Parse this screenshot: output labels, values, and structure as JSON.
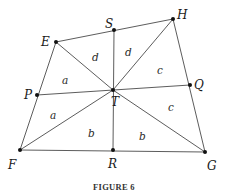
{
  "figure": {
    "caption": "FIGURE 6",
    "points": {
      "E": {
        "label": "E",
        "x": 56,
        "y": 42
      },
      "S": {
        "label": "S",
        "x": 114,
        "y": 30
      },
      "H": {
        "label": "H",
        "x": 173,
        "y": 19
      },
      "Q": {
        "label": "Q",
        "x": 190,
        "y": 85
      },
      "G": {
        "label": "G",
        "x": 205,
        "y": 152
      },
      "R": {
        "label": "R",
        "x": 113,
        "y": 150
      },
      "F": {
        "label": "F",
        "x": 20,
        "y": 150
      },
      "P": {
        "label": "P",
        "x": 37,
        "y": 95
      },
      "T": {
        "label": "T",
        "x": 113,
        "y": 90
      }
    },
    "region_labels": [
      {
        "id": "d1",
        "text": "d"
      },
      {
        "id": "d2",
        "text": "d"
      },
      {
        "id": "c1",
        "text": "c"
      },
      {
        "id": "c2",
        "text": "c"
      },
      {
        "id": "a1",
        "text": "a"
      },
      {
        "id": "a2",
        "text": "a"
      },
      {
        "id": "b1",
        "text": "b"
      },
      {
        "id": "b2",
        "text": "b"
      }
    ]
  }
}
